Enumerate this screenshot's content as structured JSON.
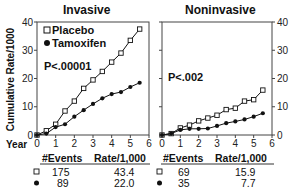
{
  "chart_data": [
    {
      "type": "line",
      "title": "Invasive",
      "xlabel": "Year",
      "ylabel": "Cumulative Rate/1000",
      "x": [
        0,
        0.5,
        1,
        1.5,
        2,
        2.5,
        3,
        3.5,
        4,
        4.5,
        5,
        5.5
      ],
      "xlim": [
        0,
        6
      ],
      "ylim": [
        0,
        40
      ],
      "xticks": [
        0,
        1,
        2,
        3,
        4,
        5,
        6
      ],
      "yticks": [
        0,
        10,
        20,
        30,
        40
      ],
      "annotation": "P<.00001",
      "legend": [
        "Placebo",
        "Tamoxifen"
      ],
      "series": [
        {
          "name": "Placebo",
          "marker": "open-square",
          "values": [
            0,
            1.5,
            3.8,
            8.5,
            12,
            16.5,
            19.5,
            22.5,
            25.8,
            29,
            33.5,
            37.5
          ]
        },
        {
          "name": "Tamoxifen",
          "marker": "filled-circle",
          "values": [
            0,
            0.5,
            2.8,
            3.8,
            6.5,
            8.8,
            11,
            13,
            14.5,
            15.2,
            17,
            18.5
          ]
        }
      ],
      "table": {
        "headers": [
          "#Events",
          "Rate/1,000"
        ],
        "rows": [
          [
            "Placebo",
            "175",
            "43.4"
          ],
          [
            "Tamoxifen",
            "89",
            "22.0"
          ]
        ]
      }
    },
    {
      "type": "line",
      "title": "Noninvasive",
      "xlabel": "Year",
      "ylabel": "Cumulative Rate/1000",
      "x": [
        0,
        0.5,
        1,
        1.5,
        2,
        2.5,
        3,
        3.5,
        4,
        4.5,
        5,
        5.5
      ],
      "xlim": [
        0,
        6
      ],
      "ylim": [
        0,
        40
      ],
      "xticks": [
        0,
        1,
        2,
        3,
        4,
        5,
        6
      ],
      "yticks": [
        0,
        10,
        20,
        30,
        40
      ],
      "annotation": "P<.002",
      "series": [
        {
          "name": "Placebo",
          "marker": "open-square",
          "values": [
            0,
            0.5,
            2.5,
            3.5,
            5,
            6,
            7,
            9,
            9.5,
            12,
            12.5,
            15.9
          ]
        },
        {
          "name": "Tamoxifen",
          "marker": "filled-circle",
          "values": [
            0,
            0.5,
            1.8,
            2.2,
            2.2,
            2.3,
            3.2,
            4.2,
            4.8,
            5.5,
            6.5,
            7.7
          ]
        }
      ],
      "table": {
        "headers": [
          "#Events",
          "Rate/1,000"
        ],
        "rows": [
          [
            "Placebo",
            "69",
            "15.9"
          ],
          [
            "Tamoxifen",
            "35",
            "7.7"
          ]
        ]
      }
    }
  ],
  "labels": {
    "title_left": "Invasive",
    "title_right": "Noninvasive",
    "ylabel": "Cumulative Rate/1000",
    "year": "Year",
    "legend_placebo": "Placebo",
    "legend_tamoxifen": "Tamoxifen",
    "p_left": "P<.00001",
    "p_right": "P<.002",
    "hdr_events": "#Events",
    "hdr_rate": "Rate/1,000",
    "l_placebo_events": "175",
    "l_placebo_rate": "43.4",
    "l_tam_events": "89",
    "l_tam_rate": "22.0",
    "r_placebo_events": "69",
    "r_placebo_rate": "15.9",
    "r_tam_events": "35",
    "r_tam_rate": "7.7"
  }
}
